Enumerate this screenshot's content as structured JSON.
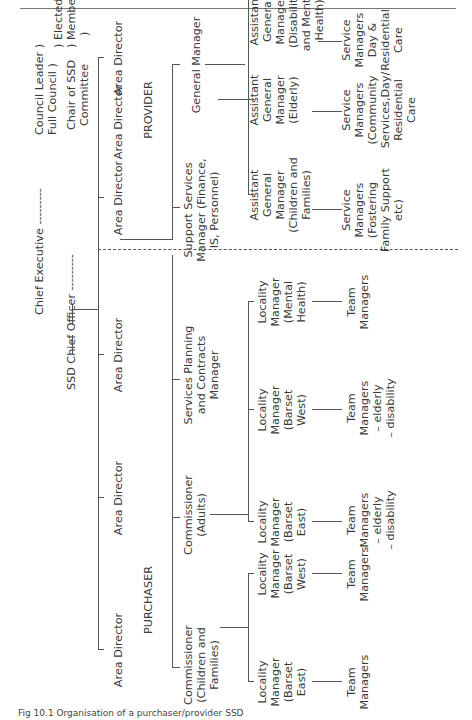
{
  "caption": "Fig 10.1 Organisation of a purchaser/provider SSD",
  "top": {
    "chief_executive": "Chief Executive ---------",
    "ssd_chief_officer": "SSD Chief Officer ---------",
    "council_leader": "Council Leader  )",
    "full_council": "Full Council      )",
    "elected": ") Elected",
    "members": ") Members",
    "chair_line1": "Chair of SSD",
    "chair_line2": "Committee",
    "paren_close": ")"
  },
  "sections": {
    "provider": "PROVIDER",
    "purchaser": "PURCHASER"
  },
  "area_directors": [
    "Area Director",
    "Area Director",
    "Area Director",
    "Area Director",
    "Area Director",
    "Area Director"
  ],
  "provider": {
    "support_services": [
      "Support Services",
      "Manager (Finance,",
      "IS, Personnel)"
    ],
    "general_manager": "General Manager",
    "assistant_gms": [
      [
        "Assistant",
        "General",
        "Manager",
        "(Children and",
        "Families)"
      ],
      [
        "Assistant",
        "General",
        "Manager",
        "(Elderly)"
      ],
      [
        "Assistant",
        "General",
        "Manager",
        "(Disability",
        "and Mental",
        "Health)"
      ]
    ],
    "service_managers": [
      [
        "Service",
        "Managers",
        "(Fostering",
        "Family Support",
        "etc)"
      ],
      [
        "Service",
        "Managers",
        "(Community",
        "Services,Day/",
        "Residential",
        "Care"
      ],
      [
        "Service",
        "Managers",
        "Day &",
        "Residential",
        "Care"
      ]
    ]
  },
  "purchaser": {
    "services_planning": [
      "Services Planning",
      "and Contracts",
      "Manager"
    ],
    "commissioner_adults": [
      "Commissioner",
      "(Adults)"
    ],
    "commissioner_children": [
      "Commissioner",
      "(Children and",
      "Families)"
    ],
    "locality_managers": [
      [
        "Locality",
        "Manager",
        "(Mental",
        "Health)"
      ],
      [
        "Locality",
        "Manager",
        "(Barset",
        "West)"
      ],
      [
        "Locality",
        "Manager",
        "(Barset",
        "East)"
      ],
      [
        "Locality",
        "Manager",
        "(Barset",
        "West)"
      ],
      [
        "Locality",
        "Manager",
        "(Barset",
        "East)"
      ]
    ],
    "team_managers": [
      [
        "Team",
        "Managers"
      ],
      [
        "Team",
        "Managers",
        "– elderly",
        "– disability"
      ],
      [
        "Team",
        "Managers",
        "– elderly",
        "– disability"
      ],
      [
        "Team",
        "Managers"
      ],
      [
        "Team",
        "Managers"
      ]
    ]
  }
}
